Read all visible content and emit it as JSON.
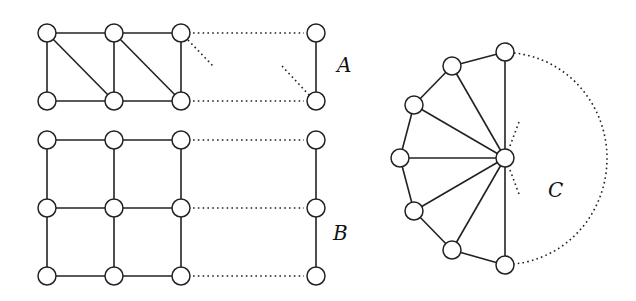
{
  "diagram": {
    "type": "graph-families",
    "node_radius": 9,
    "colors": {
      "stroke": "#222222",
      "node_fill": "#ffffff",
      "background": "#ffffff"
    },
    "graphs": [
      {
        "id": "A",
        "label": "A",
        "label_pos": [
          337,
          72
        ],
        "description": "triangulated ladder (2-row strip with diagonals), continued by dotted edges",
        "nodes": [
          {
            "id": "a1",
            "x": 47,
            "y": 33
          },
          {
            "id": "a2",
            "x": 114,
            "y": 33
          },
          {
            "id": "a3",
            "x": 181,
            "y": 33
          },
          {
            "id": "a4",
            "x": 316,
            "y": 33
          },
          {
            "id": "a5",
            "x": 47,
            "y": 101
          },
          {
            "id": "a6",
            "x": 114,
            "y": 101
          },
          {
            "id": "a7",
            "x": 181,
            "y": 101
          },
          {
            "id": "a8",
            "x": 316,
            "y": 101
          }
        ],
        "edges": [
          [
            "a1",
            "a2"
          ],
          [
            "a2",
            "a3"
          ],
          [
            "a5",
            "a6"
          ],
          [
            "a6",
            "a7"
          ],
          [
            "a1",
            "a5"
          ],
          [
            "a2",
            "a6"
          ],
          [
            "a3",
            "a7"
          ],
          [
            "a4",
            "a8"
          ],
          [
            "a1",
            "a6"
          ],
          [
            "a2",
            "a7"
          ]
        ],
        "dotted_edges": [
          [
            "a3",
            "a4"
          ],
          [
            "a7",
            "a8"
          ]
        ],
        "dotted_stubs": [
          {
            "from": [
              188,
              40
            ],
            "to": [
              213,
              66
            ]
          },
          {
            "from": [
              282,
              66
            ],
            "to": [
              309,
              95
            ]
          }
        ]
      },
      {
        "id": "B",
        "label": "B",
        "label_pos": [
          333,
          240
        ],
        "description": "3-row grid graph continued by dotted edges",
        "nodes": [
          {
            "id": "b1",
            "x": 47,
            "y": 140
          },
          {
            "id": "b2",
            "x": 114,
            "y": 140
          },
          {
            "id": "b3",
            "x": 181,
            "y": 140
          },
          {
            "id": "b4",
            "x": 316,
            "y": 140
          },
          {
            "id": "b5",
            "x": 47,
            "y": 208
          },
          {
            "id": "b6",
            "x": 114,
            "y": 208
          },
          {
            "id": "b7",
            "x": 181,
            "y": 208
          },
          {
            "id": "b8",
            "x": 316,
            "y": 208
          },
          {
            "id": "b9",
            "x": 47,
            "y": 276
          },
          {
            "id": "b10",
            "x": 114,
            "y": 276
          },
          {
            "id": "b11",
            "x": 181,
            "y": 276
          },
          {
            "id": "b12",
            "x": 316,
            "y": 276
          }
        ],
        "edges": [
          [
            "b1",
            "b2"
          ],
          [
            "b2",
            "b3"
          ],
          [
            "b5",
            "b6"
          ],
          [
            "b6",
            "b7"
          ],
          [
            "b9",
            "b10"
          ],
          [
            "b10",
            "b11"
          ],
          [
            "b1",
            "b5"
          ],
          [
            "b5",
            "b9"
          ],
          [
            "b2",
            "b6"
          ],
          [
            "b6",
            "b10"
          ],
          [
            "b3",
            "b7"
          ],
          [
            "b7",
            "b11"
          ],
          [
            "b4",
            "b8"
          ],
          [
            "b8",
            "b12"
          ]
        ],
        "dotted_edges": [
          [
            "b3",
            "b4"
          ],
          [
            "b7",
            "b8"
          ],
          [
            "b11",
            "b12"
          ]
        ],
        "dotted_stubs": []
      },
      {
        "id": "C",
        "label": "C",
        "label_pos": [
          548,
          197
        ],
        "description": "fan / wheel segment: hub joined to a path of outer vertices, closed by dotted arc",
        "nodes": [
          {
            "id": "hub",
            "x": 505,
            "y": 158
          },
          {
            "id": "c1",
            "x": 505,
            "y": 52
          },
          {
            "id": "c2",
            "x": 452,
            "y": 66
          },
          {
            "id": "c3",
            "x": 414,
            "y": 105
          },
          {
            "id": "c4",
            "x": 400,
            "y": 158
          },
          {
            "id": "c5",
            "x": 414,
            "y": 211
          },
          {
            "id": "c6",
            "x": 452,
            "y": 250
          },
          {
            "id": "c7",
            "x": 505,
            "y": 265
          }
        ],
        "edges": [
          [
            "c1",
            "c2"
          ],
          [
            "c2",
            "c3"
          ],
          [
            "c3",
            "c4"
          ],
          [
            "c4",
            "c5"
          ],
          [
            "c5",
            "c6"
          ],
          [
            "c6",
            "c7"
          ],
          [
            "hub",
            "c1"
          ],
          [
            "hub",
            "c2"
          ],
          [
            "hub",
            "c3"
          ],
          [
            "hub",
            "c4"
          ],
          [
            "hub",
            "c5"
          ],
          [
            "hub",
            "c6"
          ],
          [
            "hub",
            "c7"
          ]
        ],
        "dotted_edges": [],
        "dotted_arc": {
          "from": [
            514,
            53
          ],
          "to": [
            514,
            264
          ],
          "rx": 103,
          "ry": 106
        },
        "dotted_stubs": [
          {
            "from": [
              510,
              146
            ],
            "to": [
              519,
              122
            ]
          },
          {
            "from": [
              510,
              170
            ],
            "to": [
              519,
              194
            ]
          }
        ]
      }
    ]
  }
}
